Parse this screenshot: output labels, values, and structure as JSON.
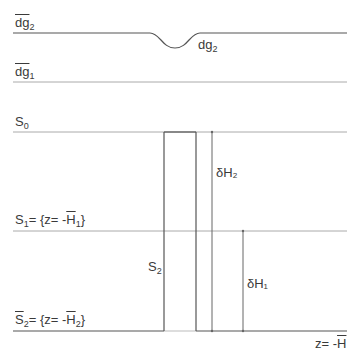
{
  "diagram": {
    "labels": {
      "dg2_bar": {
        "base": "dg",
        "sub": "2",
        "overline": true
      },
      "dg2": {
        "base": "dg",
        "sub": "2"
      },
      "dg1_bar": {
        "base": "dg",
        "sub": "1",
        "overline": true
      },
      "S0": {
        "base": "S",
        "sub": "0"
      },
      "S1": {
        "base": "S",
        "sub": "1",
        "eq": "= {z= -",
        "H": "H",
        "Hsub": "1",
        "close": "}"
      },
      "S2_bar": {
        "base": "S",
        "sub": "2",
        "eq": "= {z= -",
        "H": "H",
        "Hsub": "2",
        "close": "}"
      },
      "S2": {
        "base": "S",
        "sub": "2"
      },
      "dH2": "δH₂",
      "dH1": "δH₁",
      "bottom": {
        "eq": "z= -",
        "H": "H"
      }
    },
    "colors": {
      "line": "#555555",
      "thin": "#999999",
      "text": "#3a3a3a"
    }
  }
}
